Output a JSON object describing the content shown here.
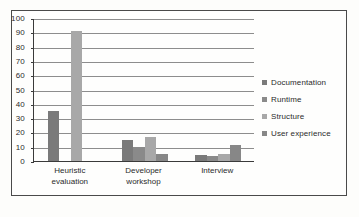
{
  "chart_data": {
    "type": "bar",
    "title": "",
    "subtitle": "",
    "xlabel": "",
    "ylabel": "",
    "categories": [
      "Heuristic evaluation",
      "Developer workshop",
      "Interview"
    ],
    "series": [
      {
        "name": "Documentation",
        "values": [
          35,
          15,
          4
        ],
        "color": "#7a7a7a"
      },
      {
        "name": "Runtime",
        "values": [
          0,
          10,
          3.5
        ],
        "color": "#8a8a8a"
      },
      {
        "name": "Structure",
        "values": [
          91,
          17,
          5
        ],
        "color": "#a8a8a8"
      },
      {
        "name": "User experience",
        "values": [
          0,
          5,
          11
        ],
        "color": "#878787"
      }
    ],
    "ylim": [
      0,
      100
    ],
    "yticks": [
      0,
      10,
      20,
      30,
      40,
      50,
      60,
      70,
      80,
      90,
      100
    ],
    "ytick_labels": [
      "0",
      "10",
      "20",
      "30",
      "40",
      "50",
      "60",
      "70",
      "80",
      "90",
      "100"
    ],
    "grid": true,
    "grid_axis": "y",
    "legend_position": "right",
    "legend_entries": [
      "Documentation",
      "Runtime",
      "Structure",
      "User experience"
    ],
    "axis_color": "#3a3a3a",
    "grid_color": "#8d8d8d",
    "frame_color": "#4a4a4a",
    "background_color": "#fefefd"
  }
}
